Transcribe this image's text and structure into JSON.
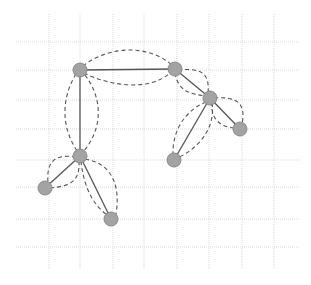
{
  "diagram": {
    "type": "graph",
    "background": "#ffffff",
    "grid": {
      "color": "#d9d9d9",
      "x_lines": [
        49,
        80,
        113,
        144,
        177,
        209,
        242,
        274
      ],
      "y_lines": [
        42,
        70,
        100,
        129,
        160,
        187,
        219,
        247
      ],
      "x_extent": [
        16,
        300
      ],
      "y_extent": [
        14,
        270
      ]
    },
    "node_style": {
      "fill": "#a3a3a3",
      "stroke": "#8a8a8a",
      "radius": 7
    },
    "edge_color": "#555555",
    "nodes": [
      {
        "id": "A",
        "x": 80,
        "y": 70
      },
      {
        "id": "B",
        "x": 175,
        "y": 69
      },
      {
        "id": "C",
        "x": 210,
        "y": 98
      },
      {
        "id": "D",
        "x": 80,
        "y": 156
      },
      {
        "id": "E",
        "x": 45,
        "y": 188
      },
      {
        "id": "F",
        "x": 111,
        "y": 219
      },
      {
        "id": "G",
        "x": 174,
        "y": 160
      },
      {
        "id": "H",
        "x": 240,
        "y": 129
      }
    ],
    "solid_edges": [
      [
        "A",
        "B"
      ],
      [
        "A",
        "D"
      ],
      [
        "B",
        "C"
      ],
      [
        "C",
        "G"
      ],
      [
        "C",
        "H"
      ],
      [
        "D",
        "E"
      ],
      [
        "D",
        "F"
      ]
    ],
    "dashed_edges": [
      {
        "d": "M83,66 C105,48 145,42 172,65"
      },
      {
        "d": "M84,73 C110,86 150,92 171,72"
      },
      {
        "d": "M76,74 C60,100 62,130 78,152"
      },
      {
        "d": "M85,75 C104,100 102,130 83,152"
      },
      {
        "d": "M178,70 C200,68 210,72 208,93"
      },
      {
        "d": "M175,73 C178,90 188,94 206,96"
      },
      {
        "d": "M214,98 C238,96 246,104 242,124"
      },
      {
        "d": "M212,102 C210,120 222,128 236,128"
      },
      {
        "d": "M206,102 C186,110 172,130 173,155"
      },
      {
        "d": "M212,103 C216,130 196,150 177,158"
      },
      {
        "d": "M76,157 C56,154 46,160 48,183"
      },
      {
        "d": "M79,161 C80,182 70,186 50,188"
      },
      {
        "d": "M85,159 C115,164 120,190 116,214"
      },
      {
        "d": "M81,161 C84,190 95,206 107,215"
      }
    ]
  }
}
